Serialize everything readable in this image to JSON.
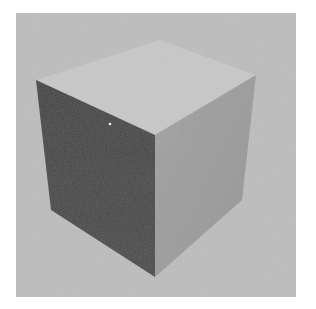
{
  "image": {
    "description": "Rendered gray 3D cube on a light gray backdrop with white border",
    "width": 316,
    "height": 309
  },
  "colors": {
    "frame": "#ffffff",
    "backdrop": "#bdbdbd",
    "top_face": "#c8c8c8",
    "left_face": "#484848",
    "right_face": "#9c9c9c",
    "highlight": "#f0f0f0"
  },
  "backdrop_rect": {
    "x": 16,
    "y": 13,
    "width": 280,
    "height": 284
  },
  "cube": {
    "vertices": {
      "top_back": [
        160,
        40
      ],
      "top_left": [
        36,
        80
      ],
      "top_right": [
        256,
        75
      ],
      "top_front": [
        155,
        135
      ],
      "bottom_left": [
        51,
        210
      ],
      "bottom_right": [
        242,
        200
      ],
      "bottom_front": [
        155,
        277
      ]
    },
    "faces": {
      "top": "160,40 256,75 155,135 36,80",
      "left": "36,80 155,135 155,277 51,210",
      "right": "155,135 256,75 242,200 155,277"
    },
    "speck": {
      "x": 110,
      "y": 124,
      "r": 1.3
    }
  }
}
